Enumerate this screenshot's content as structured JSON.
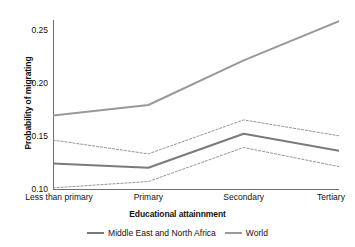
{
  "chart_data": {
    "type": "line",
    "title": "",
    "xlabel": "Educational attainnment",
    "ylabel": "Probability of migrating",
    "categories": [
      "Less than primary",
      "Primary",
      "Secondary",
      "Tertiary"
    ],
    "ylim": [
      0.1,
      0.26
    ],
    "yticks": [
      0.1,
      0.15,
      0.2,
      0.25
    ],
    "ytick_labels": [
      "0.10",
      "0.15",
      "0.20",
      "0.25"
    ],
    "grid": false,
    "legend_position": "bottom-center",
    "series": [
      {
        "name": "Middle East and North Africa",
        "style": "solid",
        "color": "#7a7a7a",
        "values": [
          0.125,
          0.121,
          0.153,
          0.137
        ]
      },
      {
        "name": "World",
        "style": "solid",
        "color": "#999999",
        "values": [
          0.17,
          0.18,
          0.222,
          0.259
        ]
      },
      {
        "name": "Middle East and North Africa upper confidence bound",
        "style": "dashed",
        "color": "#8a8a8a",
        "values": [
          0.147,
          0.134,
          0.166,
          0.151
        ]
      },
      {
        "name": "Middle East and North Africa lower confidence bound",
        "style": "dashed",
        "color": "#8a8a8a",
        "values": [
          0.102,
          0.108,
          0.14,
          0.122
        ]
      }
    ],
    "legend": [
      {
        "label": "Middle East and North Africa",
        "color": "#7a7a7a"
      },
      {
        "label": "World",
        "color": "#999999"
      }
    ]
  }
}
